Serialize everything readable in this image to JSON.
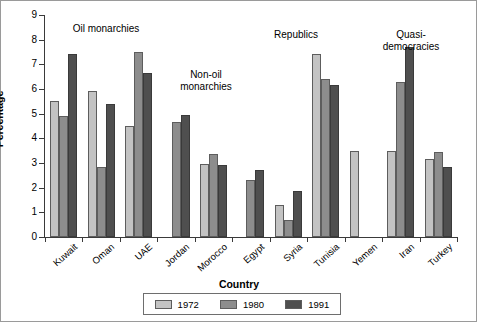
{
  "chart_data": {
    "type": "bar",
    "title": "",
    "xlabel": "Country",
    "ylabel": "Percentage",
    "ylim": [
      0,
      9
    ],
    "yticks": [
      0,
      1,
      2,
      3,
      4,
      5,
      6,
      7,
      8,
      9
    ],
    "grid": false,
    "legend_position": "bottom",
    "categories": [
      "Kuwait",
      "Oman",
      "UAE",
      "Jordan",
      "Morocco",
      "Egypt",
      "Syria",
      "Tunisia",
      "Yemen",
      "Iran",
      "Turkey"
    ],
    "series": [
      {
        "name": "1972",
        "color": "#c3c3c3",
        "values": [
          5.5,
          5.9,
          4.5,
          null,
          2.95,
          null,
          1.3,
          7.4,
          3.5,
          3.5,
          3.15
        ]
      },
      {
        "name": "1980",
        "color": "#8d8d8d",
        "values": [
          4.9,
          2.85,
          7.5,
          4.65,
          3.35,
          2.3,
          0.7,
          6.4,
          null,
          6.3,
          3.45
        ]
      },
      {
        "name": "1991",
        "color": "#4f4f4f",
        "values": [
          7.4,
          5.4,
          6.65,
          4.95,
          2.9,
          2.7,
          1.85,
          6.15,
          null,
          7.7,
          2.85
        ]
      }
    ],
    "annotations": [
      {
        "text": "Oil monarchies",
        "x": 105,
        "y": 22
      },
      {
        "text": "Non-oil\nmonarchies",
        "x": 205,
        "y": 68
      },
      {
        "text": "Republics",
        "x": 295,
        "y": 28
      },
      {
        "text": "Quasi-democracies",
        "x": 410,
        "y": 28
      }
    ]
  },
  "legend": {
    "items": [
      {
        "label": "1972",
        "swatch": "#c3c3c3"
      },
      {
        "label": "1980",
        "swatch": "#8d8d8d"
      },
      {
        "label": "1991",
        "swatch": "#4f4f4f"
      }
    ]
  }
}
